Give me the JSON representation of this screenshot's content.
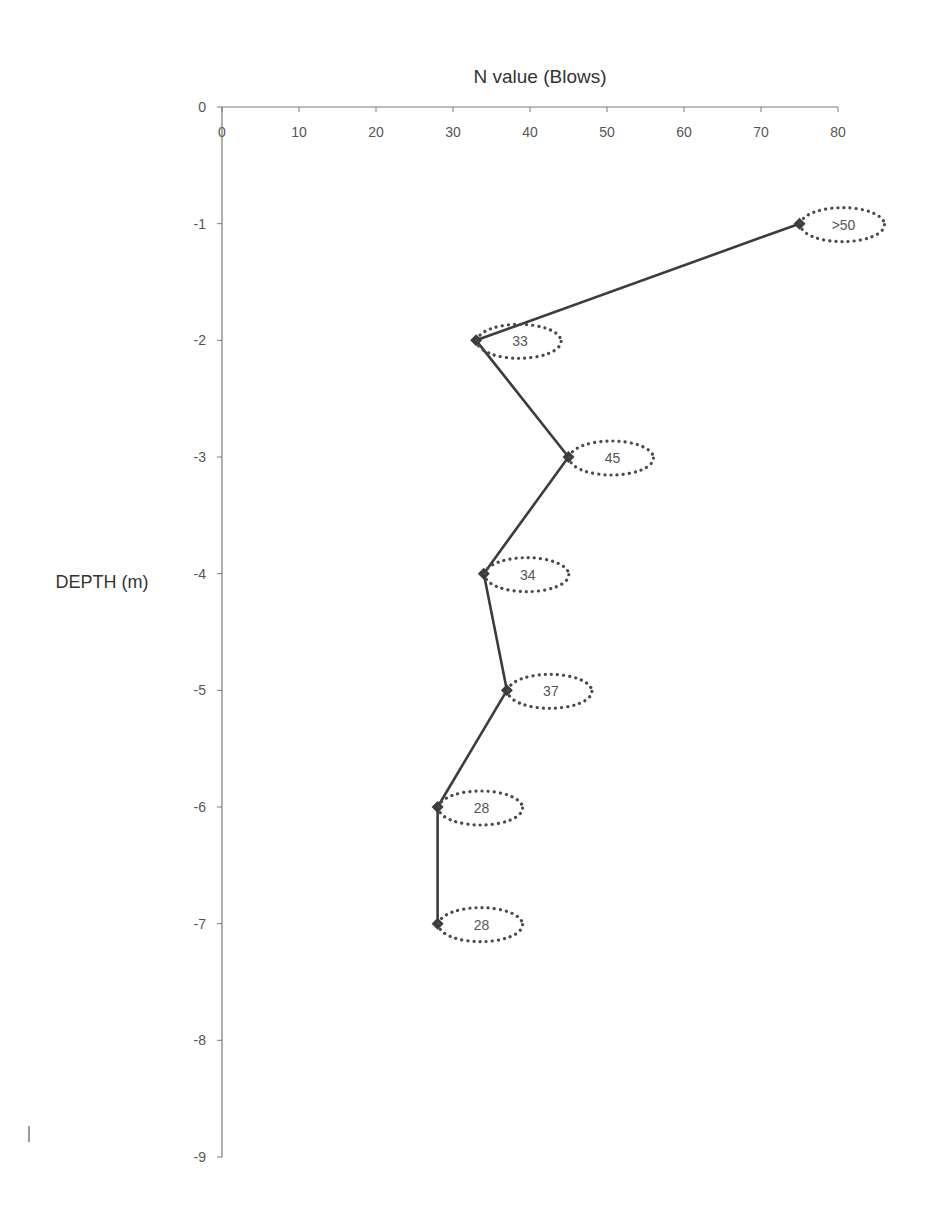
{
  "chart_data": {
    "type": "line",
    "title": "N value (Blows)",
    "xlabel": "N value (Blows)",
    "ylabel": "DEPTH (m)",
    "x_axis_position": "top",
    "xlim": [
      0,
      80
    ],
    "ylim": [
      -9,
      0
    ],
    "x_ticks": [
      0,
      10,
      20,
      30,
      40,
      50,
      60,
      70,
      80
    ],
    "y_ticks": [
      0,
      -1,
      -2,
      -3,
      -4,
      -5,
      -6,
      -7,
      -8,
      -9
    ],
    "grid": false,
    "legend": null,
    "series": [
      {
        "name": "SPT N value",
        "marker": "diamond",
        "color": "#3c3c3c",
        "points": [
          {
            "x": 75,
            "y": -1,
            "label": ">50"
          },
          {
            "x": 33,
            "y": -2,
            "label": "33"
          },
          {
            "x": 45,
            "y": -3,
            "label": "45"
          },
          {
            "x": 34,
            "y": -4,
            "label": "34"
          },
          {
            "x": 37,
            "y": -5,
            "label": "37"
          },
          {
            "x": 28,
            "y": -6,
            "label": "28"
          },
          {
            "x": 28,
            "y": -7,
            "label": "28"
          }
        ]
      }
    ],
    "annotations": "Data labels shown inside dotted ellipses to the right of each point"
  },
  "colors": {
    "line": "#3c3c3c",
    "axis": "#7a7a7a",
    "text": "#555555",
    "dotted_ellipse": "#4a4a4a"
  }
}
